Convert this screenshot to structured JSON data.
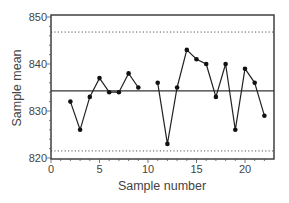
{
  "chart_data": {
    "type": "line",
    "title": "",
    "xlabel": "Sample number",
    "ylabel": "Sample mean",
    "xlim": [
      0,
      23
    ],
    "ylim": [
      820,
      850
    ],
    "x_ticks": [
      0,
      5,
      10,
      15,
      20
    ],
    "y_ticks": [
      820,
      830,
      840,
      850
    ],
    "grid": false,
    "legend": null,
    "series": [
      {
        "name": "Sample mean",
        "style": "line-with-markers",
        "segments": [
          {
            "x": [
              2,
              3,
              4,
              5,
              6,
              7,
              8,
              9
            ],
            "y": [
              832,
              826,
              833,
              837,
              834,
              834,
              838,
              835
            ]
          },
          {
            "x": [
              11,
              12,
              13,
              14,
              15,
              16,
              17,
              18,
              19,
              20,
              21,
              22
            ],
            "y": [
              836,
              823,
              835,
              843,
              841,
              840,
              833,
              840,
              826,
              839,
              836,
              829
            ]
          }
        ]
      }
    ],
    "reference_lines": [
      {
        "name": "Upper control limit",
        "y": 846.8,
        "style": "dotted"
      },
      {
        "name": "Center line",
        "y": 834.3,
        "style": "solid"
      },
      {
        "name": "Lower control limit",
        "y": 821.5,
        "style": "dotted"
      }
    ]
  },
  "labels": {
    "xlabel": "Sample number",
    "ylabel": "Sample mean",
    "x_tick_labels": [
      "0",
      "5",
      "10",
      "15",
      "20"
    ],
    "y_tick_labels": [
      "820",
      "830",
      "840",
      "850"
    ]
  }
}
